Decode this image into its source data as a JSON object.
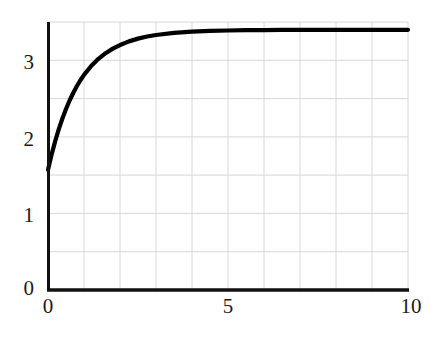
{
  "chart_data": {
    "type": "line",
    "title": "",
    "xlabel": "",
    "ylabel": "",
    "xlim": [
      0,
      10
    ],
    "ylim": [
      0,
      3.5
    ],
    "grid": true,
    "grid_color": "#d8d8d8",
    "axis_color": "#111111",
    "line_color": "#000000",
    "line_width": 4,
    "legend": null,
    "legend_position": "none",
    "xticks": [
      0,
      5,
      10
    ],
    "xtick_labels": [
      "0",
      "5",
      "10"
    ],
    "yticks": [
      0,
      1,
      2,
      3
    ],
    "ytick_labels": [
      "0",
      "1",
      "2",
      "3"
    ],
    "x_gridlines": [
      0,
      1,
      2,
      3,
      4,
      5,
      6,
      7,
      8,
      9,
      10
    ],
    "y_gridlines": [
      0,
      0.5,
      1,
      1.5,
      2,
      2.5,
      3,
      3.5
    ],
    "series": [
      {
        "name": "curve",
        "color": "#000000",
        "x": [
          0.0,
          0.1,
          0.2,
          0.3,
          0.4,
          0.5,
          0.6,
          0.7,
          0.8,
          0.9,
          1.0,
          1.2,
          1.4,
          1.6,
          1.8,
          2.0,
          2.25,
          2.5,
          2.75,
          3.0,
          3.5,
          4.0,
          4.5,
          5.0,
          5.5,
          6.0,
          6.5,
          7.0,
          7.5,
          8.0,
          8.5,
          9.0,
          9.5,
          10.0
        ],
        "y": [
          1.571,
          1.768,
          1.944,
          2.101,
          2.24,
          2.364,
          2.475,
          2.573,
          2.661,
          2.739,
          2.809,
          2.926,
          3.019,
          3.093,
          3.152,
          3.199,
          3.247,
          3.283,
          3.31,
          3.33,
          3.357,
          3.373,
          3.383,
          3.389,
          3.393,
          3.395,
          3.396,
          3.397,
          3.398,
          3.398,
          3.398,
          3.398,
          3.398,
          3.398
        ],
        "start_value": 1.571,
        "asymptote": 3.142,
        "note": "exponential saturation from pi/2 to pi"
      }
    ]
  },
  "axes": {
    "y_tick_0": "0",
    "y_tick_1": "1",
    "y_tick_2": "2",
    "y_tick_3": "3",
    "x_tick_0": "0",
    "x_tick_5": "5",
    "x_tick_10": "10"
  }
}
